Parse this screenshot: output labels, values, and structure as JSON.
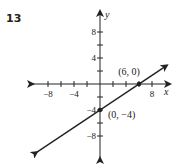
{
  "problem_number": "13",
  "chart_data": {
    "type": "line",
    "title": "",
    "xlabel": "x",
    "ylabel": "y",
    "xlim": [
      -10,
      10
    ],
    "ylim": [
      -10,
      10
    ],
    "grid": false,
    "x_ticks": [
      -8,
      -6,
      -4,
      -2,
      2,
      4,
      6,
      8
    ],
    "y_ticks": [
      -8,
      -6,
      -4,
      -2,
      2,
      4,
      6,
      8
    ],
    "x_tick_labels": [
      {
        "value": -8,
        "label": "−8"
      },
      {
        "value": -4,
        "label": "−4"
      },
      {
        "value": 8,
        "label": "8"
      }
    ],
    "y_tick_labels": [
      {
        "value": 8,
        "label": "8"
      },
      {
        "value": 4,
        "label": "4"
      },
      {
        "value": -4,
        "label": "−4"
      },
      {
        "value": -8,
        "label": "−8"
      }
    ],
    "series": [
      {
        "name": "line",
        "equation": "y = (2/3)x - 4",
        "x": [
          -9.7,
          10.3
        ],
        "y": [
          -10.47,
          2.87
        ],
        "arrows_both_ends": true
      }
    ],
    "points": [
      {
        "x": 6,
        "y": 0,
        "label": "(6, 0)"
      },
      {
        "x": 0,
        "y": -4,
        "label": "(0, −4)"
      }
    ]
  }
}
